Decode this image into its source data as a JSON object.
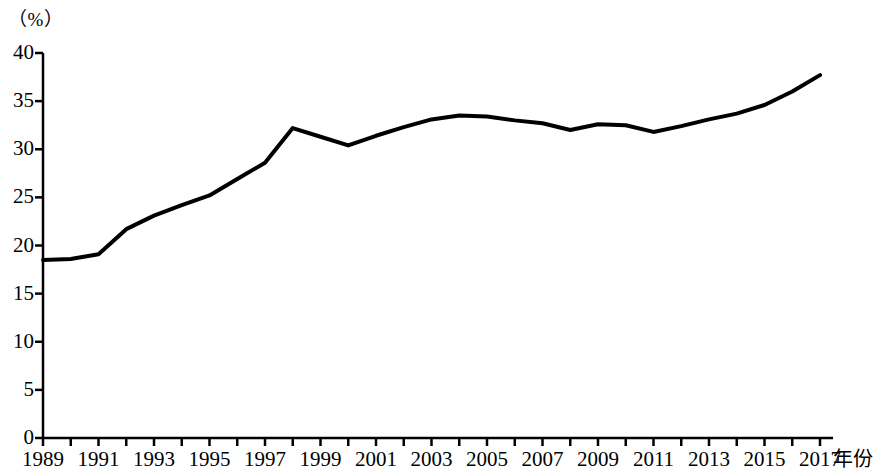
{
  "chart_data": {
    "type": "line",
    "title": "",
    "subtitle": "",
    "unit_label": "（%）",
    "ylabel": "",
    "xlabel": "年份",
    "ylim": [
      0,
      40
    ],
    "xlim": [
      1989,
      2017
    ],
    "yticks": [
      0,
      5,
      10,
      15,
      20,
      25,
      30,
      35,
      40
    ],
    "ytick_labels": [
      "0",
      "5",
      "10",
      "15",
      "20",
      "25",
      "30",
      "35",
      "40"
    ],
    "xticks": [
      1989,
      1990,
      1991,
      1992,
      1993,
      1994,
      1995,
      1996,
      1997,
      1998,
      1999,
      2000,
      2001,
      2002,
      2003,
      2004,
      2005,
      2006,
      2007,
      2008,
      2009,
      2010,
      2011,
      2012,
      2013,
      2014,
      2015,
      2016,
      2017
    ],
    "xtick_labels": [
      "1989",
      "",
      "1991",
      "",
      "1993",
      "",
      "1995",
      "",
      "1997",
      "",
      "1999",
      "",
      "2001",
      "",
      "2003",
      "",
      "2005",
      "",
      "2007",
      "",
      "2009",
      "",
      "2011",
      "",
      "2013",
      "",
      "2015",
      "",
      "2017"
    ],
    "grid": false,
    "legend": false,
    "line_color": "#000000",
    "line_width": 4,
    "series": [
      {
        "name": "",
        "x": [
          1989,
          1990,
          1991,
          1992,
          1993,
          1994,
          1995,
          1996,
          1997,
          1998,
          1999,
          2000,
          2001,
          2002,
          2003,
          2004,
          2005,
          2006,
          2007,
          2008,
          2009,
          2010,
          2011,
          2012,
          2013,
          2014,
          2015,
          2016,
          2017
        ],
        "values": [
          18.5,
          18.6,
          19.1,
          21.7,
          23.1,
          24.2,
          25.2,
          26.9,
          28.6,
          32.2,
          31.3,
          30.4,
          31.4,
          32.3,
          33.1,
          33.5,
          33.4,
          33.0,
          32.7,
          32.0,
          32.6,
          32.5,
          31.8,
          32.4,
          33.1,
          33.7,
          34.6,
          36.0,
          37.7
        ]
      }
    ]
  }
}
